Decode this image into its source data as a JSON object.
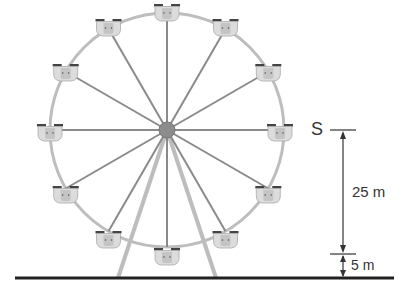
{
  "figure": {
    "gondola_count": 12,
    "labels": {
      "point": "S",
      "radius_height": "25 m",
      "base_height": "5 m"
    },
    "colors": {
      "rim": "#b8b8b8",
      "spoke": "#8a8a8a",
      "hub": "#8c8c8c",
      "gondola_fill": "#d9d9d9",
      "gondola_roof": "#444444",
      "ground": "#222222",
      "dimension_line": "#333333"
    }
  }
}
